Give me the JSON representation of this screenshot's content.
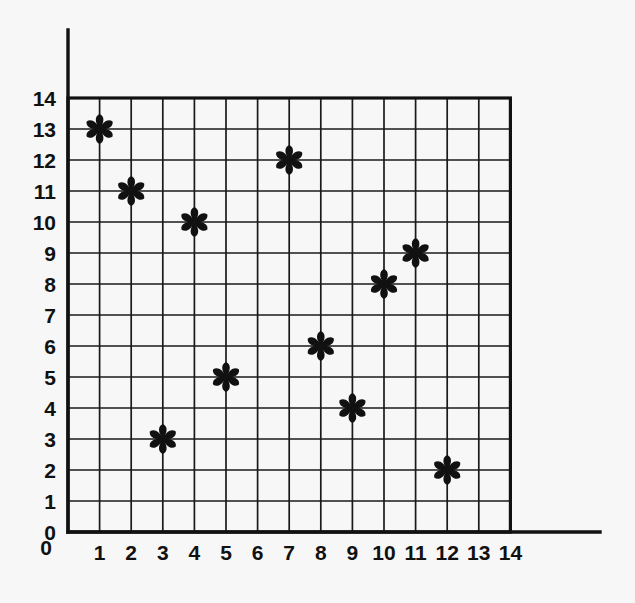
{
  "chart_data": {
    "type": "scatter",
    "title": "",
    "subtitle": "",
    "xlabel": "",
    "ylabel": "",
    "xlim": [
      0,
      14
    ],
    "ylim": [
      0,
      14
    ],
    "grid": true,
    "legend": null,
    "legend_position": "none",
    "marker_style": "six-petal-asterisk",
    "marker_color": "#111111",
    "x_ticks": [
      0,
      1,
      2,
      3,
      4,
      5,
      6,
      7,
      8,
      9,
      10,
      11,
      12,
      13,
      14
    ],
    "y_ticks": [
      0,
      1,
      2,
      3,
      4,
      5,
      6,
      7,
      8,
      9,
      10,
      11,
      12,
      13,
      14
    ],
    "x_tick_labels": [
      "0",
      "1",
      "2",
      "3",
      "4",
      "5",
      "6",
      "7",
      "8",
      "9",
      "10",
      "11",
      "12",
      "13",
      "14"
    ],
    "y_tick_labels": [
      "0",
      "1",
      "2",
      "3",
      "4",
      "5",
      "6",
      "7",
      "8",
      "9",
      "10",
      "11",
      "12",
      "13",
      "14"
    ],
    "points": [
      {
        "x": 1,
        "y": 13
      },
      {
        "x": 2,
        "y": 11
      },
      {
        "x": 3,
        "y": 3
      },
      {
        "x": 4,
        "y": 10
      },
      {
        "x": 5,
        "y": 5
      },
      {
        "x": 7,
        "y": 12
      },
      {
        "x": 8,
        "y": 6
      },
      {
        "x": 9,
        "y": 4
      },
      {
        "x": 10,
        "y": 8
      },
      {
        "x": 11,
        "y": 9
      },
      {
        "x": 12,
        "y": 2
      }
    ],
    "x_values": [
      1,
      2,
      3,
      4,
      5,
      7,
      8,
      9,
      10,
      11,
      12
    ],
    "y_values": [
      13,
      11,
      3,
      10,
      5,
      12,
      6,
      4,
      8,
      9,
      2
    ],
    "point_count": 11
  },
  "figure": {
    "background_color": "#f7f7f7",
    "ink_color": "#111111"
  }
}
